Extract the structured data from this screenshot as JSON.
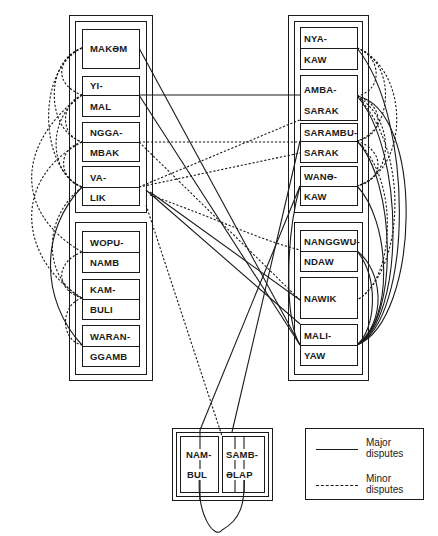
{
  "diagram": {
    "type": "dispute-network",
    "left_column": {
      "upper_group": [
        {
          "id": "makem",
          "lines": [
            "MAKƏM"
          ]
        },
        {
          "id": "yimal",
          "lines": [
            "YI-",
            "MAL"
          ]
        },
        {
          "id": "nggambak",
          "lines": [
            "NGGA-",
            "MBAK"
          ]
        },
        {
          "id": "valik",
          "lines": [
            "VA-",
            "LIK"
          ]
        }
      ],
      "lower_group": [
        {
          "id": "wopunamb",
          "lines": [
            "WOPU-",
            "NAMB"
          ]
        },
        {
          "id": "kambuli",
          "lines": [
            "KAM-",
            "BULI"
          ]
        },
        {
          "id": "waranggamb",
          "lines": [
            "WARAN-",
            "GGAMB"
          ]
        }
      ]
    },
    "right_column": {
      "upper_group": [
        {
          "id": "nyakaw",
          "lines": [
            "NYA-",
            "KAW"
          ]
        },
        {
          "id": "ambasarak",
          "lines": [
            "AMBA-",
            "SARAK"
          ]
        },
        {
          "id": "sarambusarak",
          "lines": [
            "SARAMBU-",
            "SARAK"
          ]
        },
        {
          "id": "wanekaw",
          "lines": [
            "WANƏ-",
            "KAW"
          ]
        }
      ],
      "lower_group": [
        {
          "id": "nanggwundaw",
          "lines": [
            "NANGGWU-",
            "NDAW"
          ]
        },
        {
          "id": "nawik",
          "lines": [
            "NAWIK"
          ]
        },
        {
          "id": "maliyaw",
          "lines": [
            "MALI-",
            "YAW"
          ]
        }
      ]
    },
    "bottom_group": [
      {
        "id": "nambul",
        "lines": [
          "NAM-",
          "BUL"
        ]
      },
      {
        "id": "sambelap",
        "lines": [
          "SAMB-",
          "ƏLAP"
        ]
      }
    ],
    "legend": {
      "major": {
        "line_style": "solid",
        "label": "Major disputes"
      },
      "minor": {
        "line_style": "dashed",
        "label": "Minor disputes"
      }
    },
    "colors": {
      "ink": "#1a1a1a",
      "background": "#ffffff"
    }
  }
}
